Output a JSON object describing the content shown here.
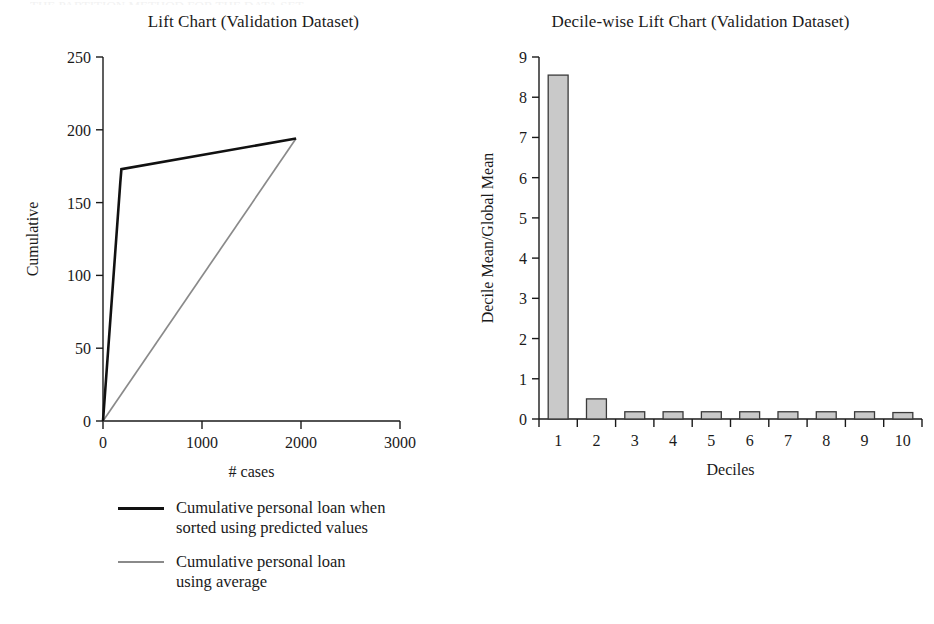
{
  "top_cropped_caption": "THE PARTITION METHOD FOR THE DATA SET",
  "left_panel": {
    "title": "Lift Chart (Validation Dataset)",
    "ylabel": "Cumulative",
    "xlabel": "# cases",
    "yticks": [
      "0",
      "50",
      "100",
      "150",
      "200",
      "250"
    ],
    "xticks": [
      "0",
      "1000",
      "2000",
      "3000"
    ],
    "legend": [
      {
        "label": "Cumulative personal loan when\nsorted using predicted values",
        "color": "#111111"
      },
      {
        "label": "Cumulative personal loan\nusing average",
        "color": "#8a8a8a"
      }
    ]
  },
  "right_panel": {
    "title": "Decile-wise Lift Chart (Validation Dataset)",
    "ylabel": "Decile Mean/Global Mean",
    "xlabel": "Deciles",
    "yticks": [
      "0",
      "1",
      "2",
      "3",
      "4",
      "5",
      "6",
      "7",
      "8",
      "9"
    ],
    "xticks": [
      "1",
      "2",
      "3",
      "4",
      "5",
      "6",
      "7",
      "8",
      "9",
      "10"
    ]
  },
  "colors": {
    "series_predicted": "#111111",
    "series_average": "#8a8a8a",
    "bar_fill": "#c9c9c9",
    "bar_stroke": "#3a3a3a",
    "axis": "#1a1a1a",
    "background": "#ffffff"
  },
  "chart_data": [
    {
      "type": "line",
      "title": "Lift Chart (Validation Dataset)",
      "xlabel": "# cases",
      "ylabel": "Cumulative",
      "xlim": [
        0,
        3000
      ],
      "ylim": [
        0,
        250
      ],
      "xticks": [
        0,
        1000,
        2000,
        3000
      ],
      "yticks": [
        0,
        50,
        100,
        150,
        200,
        250
      ],
      "grid": false,
      "legend_position": "below-left",
      "series": [
        {
          "name": "Cumulative personal loan when sorted using predicted values",
          "color": "#111111",
          "x": [
            0,
            175,
            186,
            1950
          ],
          "y": [
            0,
            164,
            173,
            194
          ]
        },
        {
          "name": "Cumulative personal loan using average",
          "color": "#8a8a8a",
          "x": [
            0,
            1950
          ],
          "y": [
            0,
            194
          ]
        }
      ]
    },
    {
      "type": "bar",
      "title": "Decile-wise Lift Chart (Validation Dataset)",
      "xlabel": "Deciles",
      "ylabel": "Decile Mean/Global Mean",
      "categories": [
        "1",
        "2",
        "3",
        "4",
        "5",
        "6",
        "7",
        "8",
        "9",
        "10"
      ],
      "values": [
        8.55,
        0.5,
        0.18,
        0.18,
        0.18,
        0.18,
        0.18,
        0.18,
        0.18,
        0.16
      ],
      "ylim": [
        0,
        9
      ],
      "yticks": [
        0,
        1,
        2,
        3,
        4,
        5,
        6,
        7,
        8,
        9
      ],
      "grid": false,
      "bar_fill": "#c9c9c9",
      "bar_stroke": "#3a3a3a"
    }
  ]
}
